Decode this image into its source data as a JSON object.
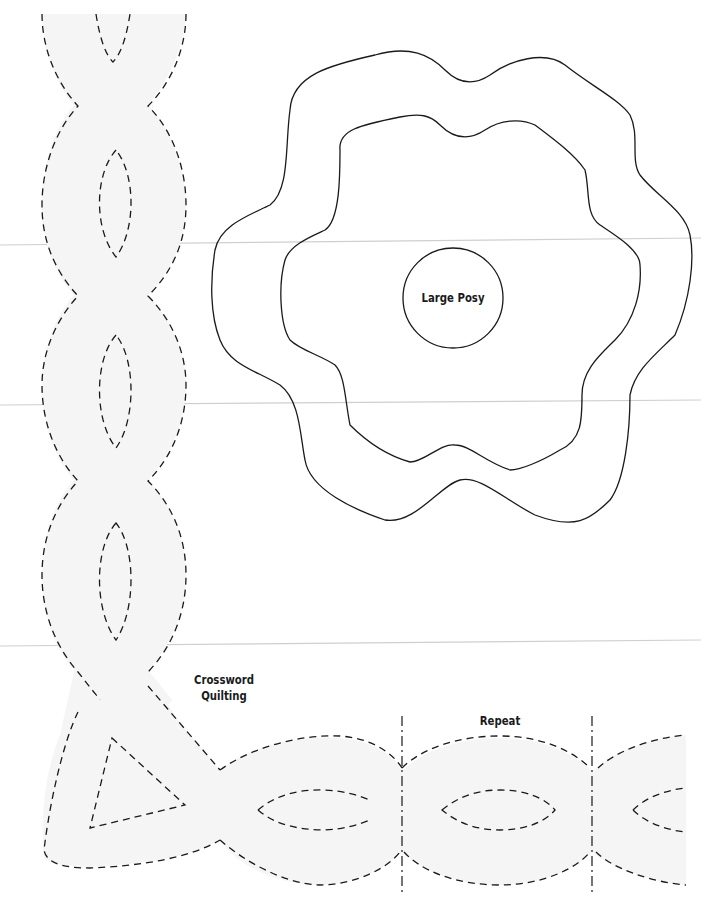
{
  "page": {
    "type": "quilting-pattern-template",
    "background": "#ffffff",
    "shape_fill": "#f5f5f5",
    "line_color": "#1a1a1a",
    "fold_line_color": "#cfcfcf"
  },
  "labels": {
    "large_posy": "Large Posy",
    "crossword_line1": "Crossword",
    "crossword_line2": "Quilting",
    "repeat": "Repeat"
  },
  "shapes": [
    {
      "name": "large-posy-outer",
      "line": "solid"
    },
    {
      "name": "large-posy-middle",
      "line": "solid"
    },
    {
      "name": "large-posy-center-circle",
      "line": "solid"
    },
    {
      "name": "cable-border-vertical",
      "line": "dashed"
    },
    {
      "name": "cable-border-horizontal",
      "line": "dashed"
    },
    {
      "name": "corner-triangle",
      "line": "dashed"
    },
    {
      "name": "repeat-marker-left",
      "line": "dash-dot"
    },
    {
      "name": "repeat-marker-right",
      "line": "dash-dot"
    }
  ]
}
